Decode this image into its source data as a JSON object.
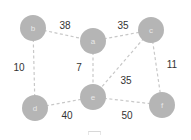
{
  "graph": {
    "nodes": [
      {
        "id": "b",
        "label": "b",
        "x": 33,
        "y": 28
      },
      {
        "id": "a",
        "label": "a",
        "x": 93,
        "y": 41
      },
      {
        "id": "c",
        "label": "c",
        "x": 151,
        "y": 30
      },
      {
        "id": "d",
        "label": "d",
        "x": 35,
        "y": 108
      },
      {
        "id": "e",
        "label": "e",
        "x": 93,
        "y": 97
      },
      {
        "id": "f",
        "label": "f",
        "x": 162,
        "y": 105
      }
    ],
    "edges": [
      {
        "from": "b",
        "to": "a",
        "weight": "38",
        "lx": 65,
        "ly": 25
      },
      {
        "from": "a",
        "to": "c",
        "weight": "35",
        "lx": 123,
        "ly": 25
      },
      {
        "from": "b",
        "to": "d",
        "weight": "10",
        "lx": 19,
        "ly": 67
      },
      {
        "from": "a",
        "to": "e",
        "weight": "7",
        "lx": 79,
        "ly": 67
      },
      {
        "from": "c",
        "to": "e",
        "weight": "35",
        "lx": 126,
        "ly": 80
      },
      {
        "from": "c",
        "to": "f",
        "weight": "11",
        "lx": 172,
        "ly": 64
      },
      {
        "from": "d",
        "to": "e",
        "weight": "40",
        "lx": 67,
        "ly": 115
      },
      {
        "from": "e",
        "to": "f",
        "weight": "50",
        "lx": 127,
        "ly": 115
      }
    ],
    "node_radius": 13,
    "colors": {
      "node": "#b5b5b5",
      "edge": "#c8c8c8",
      "label": "#333333"
    }
  }
}
